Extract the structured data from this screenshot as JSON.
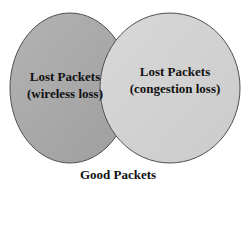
{
  "diagram": {
    "type": "venn",
    "circles": [
      {
        "id": "wireless",
        "line1": "Lost Packets",
        "line2": "(wireless loss)",
        "fill": "#a9a9a9",
        "stroke": "#555555"
      },
      {
        "id": "congestion",
        "line1": "Lost Packets",
        "line2": "(congestion loss)",
        "fill": "#d3d3d3",
        "stroke": "#555555"
      }
    ],
    "outside_label": "Good Packets",
    "background": "#ffffff"
  }
}
